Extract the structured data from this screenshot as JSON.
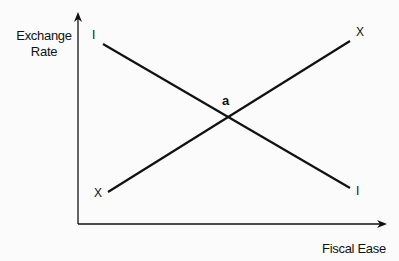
{
  "diagram": {
    "axes": {
      "y_label_line1": "Exchange",
      "y_label_line2": "Rate",
      "x_label": "Fiscal Ease"
    },
    "curves": [
      {
        "name": "I",
        "start_label": "I",
        "end_label": "I",
        "direction": "downward sloping"
      },
      {
        "name": "X",
        "start_label": "X",
        "end_label": "X",
        "direction": "upward sloping"
      }
    ],
    "intersection_label": "a",
    "colors": {
      "line": "#111111",
      "background": "#fbfbfb"
    }
  }
}
